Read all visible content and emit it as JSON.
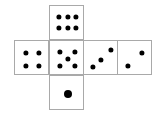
{
  "diagram": {
    "type": "cube-net",
    "canvas": {
      "width": 158,
      "height": 122
    },
    "style": {
      "face_fill": "#ffffff",
      "face_border": "#a9a9a9",
      "pip_color": "#000000",
      "background": "#ffffff"
    },
    "faces": [
      {
        "name": "top-face",
        "value": 6,
        "x": 49,
        "y": 5,
        "size": 35,
        "pip_radius": 2.6,
        "pips": [
          {
            "x": 8.5,
            "y": 10.5
          },
          {
            "x": 17.5,
            "y": 10.5
          },
          {
            "x": 26.0,
            "y": 10.5
          },
          {
            "x": 8.5,
            "y": 21.5
          },
          {
            "x": 17.5,
            "y": 21.5
          },
          {
            "x": 26.0,
            "y": 21.5
          }
        ]
      },
      {
        "name": "left-face",
        "value": 4,
        "x": 14,
        "y": 40,
        "size": 35,
        "pip_radius": 2.6,
        "pips": [
          {
            "x": 10.5,
            "y": 11.5
          },
          {
            "x": 24.0,
            "y": 11.5
          },
          {
            "x": 10.5,
            "y": 24.5
          },
          {
            "x": 24.0,
            "y": 24.5
          }
        ]
      },
      {
        "name": "center-face",
        "value": 5,
        "x": 49,
        "y": 40,
        "size": 35,
        "pip_radius": 2.6,
        "pips": [
          {
            "x": 10.0,
            "y": 10.5
          },
          {
            "x": 24.5,
            "y": 10.5
          },
          {
            "x": 17.5,
            "y": 18.0
          },
          {
            "x": 10.0,
            "y": 25.0
          },
          {
            "x": 24.5,
            "y": 25.0
          }
        ]
      },
      {
        "name": "right-face",
        "value": 3,
        "x": 83,
        "y": 40,
        "size": 35,
        "pip_radius": 2.6,
        "pips": [
          {
            "x": 8.5,
            "y": 25.5
          },
          {
            "x": 17.0,
            "y": 18.5
          },
          {
            "x": 27.0,
            "y": 9.0
          }
        ]
      },
      {
        "name": "far-right-face",
        "value": 2,
        "x": 117,
        "y": 40,
        "size": 35,
        "pip_radius": 2.6,
        "pips": [
          {
            "x": 9.5,
            "y": 25.0
          },
          {
            "x": 24.0,
            "y": 11.5
          }
        ]
      },
      {
        "name": "bottom-face",
        "value": 1,
        "x": 49,
        "y": 75,
        "size": 35,
        "pip_radius": 4.0,
        "pips": [
          {
            "x": 17.5,
            "y": 17.5
          }
        ]
      }
    ]
  }
}
